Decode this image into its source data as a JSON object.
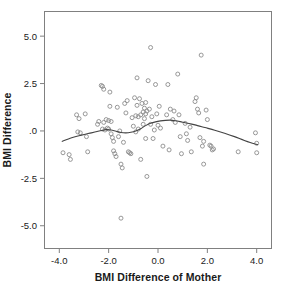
{
  "chart_data": {
    "type": "scatter",
    "title": "",
    "xlabel": "BMI Difference of Mother",
    "ylabel": "BMI Difference",
    "xlim": [
      -4.6,
      4.6
    ],
    "ylim": [
      -6.2,
      6.3
    ],
    "grid": false,
    "legend": null,
    "marker": {
      "shape": "circle",
      "filled": false,
      "color": "#8c8c8c",
      "size": 4
    },
    "xticks": [
      -4.0,
      -2.0,
      0.0,
      2.0,
      4.0
    ],
    "xticklabels": [
      "-4.0",
      "-2.0",
      "0.0",
      "2.0",
      "4.0"
    ],
    "yticks": [
      5.0,
      2.5,
      0.0,
      -2.5,
      -5.0
    ],
    "yticklabels": [
      "5.0",
      "2.5",
      ".0",
      "-2.5",
      "-5.0"
    ],
    "points": [
      [
        -3.85,
        -1.15
      ],
      [
        -3.6,
        -1.25
      ],
      [
        -3.55,
        -1.5
      ],
      [
        -3.3,
        0.85
      ],
      [
        -3.25,
        -0.05
      ],
      [
        -3.2,
        0.65
      ],
      [
        -3.15,
        -0.1
      ],
      [
        -2.95,
        0.9
      ],
      [
        -2.9,
        -0.3
      ],
      [
        -2.85,
        -1.1
      ],
      [
        -2.45,
        0.35
      ],
      [
        -2.4,
        0.5
      ],
      [
        -2.3,
        2.4
      ],
      [
        -2.25,
        2.35
      ],
      [
        -2.2,
        2.2
      ],
      [
        -2.25,
        0.1
      ],
      [
        -2.2,
        0.45
      ],
      [
        -2.15,
        0.05
      ],
      [
        -2.1,
        0.6
      ],
      [
        -2.05,
        0.15
      ],
      [
        -2.0,
        0.55
      ],
      [
        -2.0,
        0.1
      ],
      [
        -1.95,
        2.05
      ],
      [
        -1.95,
        1.3
      ],
      [
        -1.9,
        0.5
      ],
      [
        -1.9,
        -0.15
      ],
      [
        -1.85,
        -0.35
      ],
      [
        -1.8,
        -0.55
      ],
      [
        -1.8,
        -1.05
      ],
      [
        -1.75,
        -1.2
      ],
      [
        -1.7,
        -1.35
      ],
      [
        -1.65,
        1.25
      ],
      [
        -1.6,
        -0.3
      ],
      [
        -1.55,
        0.0
      ],
      [
        -1.5,
        -1.75
      ],
      [
        -1.45,
        -1.95
      ],
      [
        -1.5,
        -4.6
      ],
      [
        -1.4,
        -0.6
      ],
      [
        -1.35,
        1.45
      ],
      [
        -1.3,
        0.95
      ],
      [
        -1.25,
        1.6
      ],
      [
        -1.2,
        -1.1
      ],
      [
        -1.15,
        -1.15
      ],
      [
        -1.1,
        -1.2
      ],
      [
        -1.05,
        0.7
      ],
      [
        -1.0,
        0.25
      ],
      [
        -0.95,
        1.75
      ],
      [
        -0.9,
        0.8
      ],
      [
        -0.9,
        -0.05
      ],
      [
        -0.85,
        2.8
      ],
      [
        -0.85,
        1.35
      ],
      [
        -0.8,
        0.75
      ],
      [
        -0.8,
        0.1
      ],
      [
        -0.75,
        1.7
      ],
      [
        -0.7,
        0.85
      ],
      [
        -0.7,
        -1.5
      ],
      [
        -0.65,
        1.45
      ],
      [
        -0.6,
        1.0
      ],
      [
        -0.6,
        0.35
      ],
      [
        -0.55,
        1.2
      ],
      [
        -0.55,
        0.65
      ],
      [
        -0.5,
        1.5
      ],
      [
        -0.5,
        0.9
      ],
      [
        -0.5,
        -0.4
      ],
      [
        -0.45,
        1.05
      ],
      [
        -0.45,
        -2.4
      ],
      [
        -0.4,
        2.65
      ],
      [
        -0.35,
        1.15
      ],
      [
        -0.3,
        4.4
      ],
      [
        -0.3,
        0.35
      ],
      [
        -0.25,
        0.75
      ],
      [
        -0.2,
        -0.4
      ],
      [
        -0.15,
        0.05
      ],
      [
        -0.1,
        2.45
      ],
      [
        -0.05,
        0.9
      ],
      [
        0.0,
        0.3
      ],
      [
        0.05,
        1.3
      ],
      [
        0.1,
        0.15
      ],
      [
        0.2,
        -0.8
      ],
      [
        0.35,
        0.85
      ],
      [
        0.4,
        2.45
      ],
      [
        0.45,
        -1.0
      ],
      [
        0.5,
        1.15
      ],
      [
        0.6,
        0.6
      ],
      [
        0.65,
        1.05
      ],
      [
        0.7,
        0.45
      ],
      [
        0.8,
        3.0
      ],
      [
        0.85,
        0.85
      ],
      [
        0.9,
        -0.3
      ],
      [
        0.95,
        -1.2
      ],
      [
        1.1,
        0.4
      ],
      [
        1.15,
        -0.15
      ],
      [
        1.2,
        -0.5
      ],
      [
        1.3,
        0.2
      ],
      [
        1.35,
        -1.1
      ],
      [
        1.5,
        1.55
      ],
      [
        1.55,
        1.75
      ],
      [
        1.6,
        1.15
      ],
      [
        1.65,
        0.95
      ],
      [
        1.7,
        -0.35
      ],
      [
        1.75,
        4.0
      ],
      [
        1.8,
        -0.8
      ],
      [
        1.85,
        -0.55
      ],
      [
        1.85,
        -1.75
      ],
      [
        1.95,
        1.1
      ],
      [
        2.0,
        0.6
      ],
      [
        2.1,
        -0.75
      ],
      [
        2.15,
        -0.8
      ],
      [
        2.2,
        -1.0
      ],
      [
        2.25,
        -0.95
      ],
      [
        3.25,
        -1.1
      ],
      [
        3.95,
        -0.1
      ],
      [
        4.0,
        -1.15
      ],
      [
        4.0,
        -0.65
      ]
    ],
    "fit_curve": {
      "name": "loess smoother",
      "color": "#444444",
      "x": [
        -3.9,
        -3.5,
        -3.1,
        -2.7,
        -2.3,
        -2.1,
        -1.9,
        -1.7,
        -1.5,
        -1.3,
        -1.1,
        -0.9,
        -0.7,
        -0.5,
        -0.3,
        -0.1,
        0.1,
        0.3,
        0.5,
        0.7,
        0.9,
        1.1,
        1.3,
        1.5,
        1.9,
        2.3,
        2.7,
        3.1,
        3.5,
        3.9,
        4.05
      ],
      "y": [
        -0.56,
        -0.36,
        -0.22,
        -0.1,
        0.02,
        0.07,
        0.05,
        -0.02,
        -0.08,
        -0.1,
        -0.07,
        0.0,
        0.12,
        0.28,
        0.4,
        0.48,
        0.53,
        0.56,
        0.57,
        0.54,
        0.49,
        0.43,
        0.38,
        0.32,
        0.18,
        0.04,
        -0.12,
        -0.3,
        -0.5,
        -0.68,
        -0.72
      ]
    }
  }
}
